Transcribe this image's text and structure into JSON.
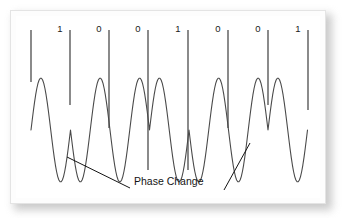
{
  "figure": {
    "kind": "phase-shift-keying-waveform-diagram",
    "background_color": "#ffffff",
    "frame_color": "#e4e4e4",
    "wave_color": "#4a4a4a",
    "tick_color": "#2b2b2b",
    "text_color": "#141414"
  },
  "bits": {
    "sequence": [
      "1",
      "0",
      "0",
      "1",
      "0",
      "0",
      "1"
    ],
    "label_x": [
      50,
      89,
      128,
      168,
      208,
      248,
      288
    ]
  },
  "annotation": {
    "text": "Phase Change",
    "leader_lines": [
      {
        "from_x": 57,
        "from_y": 147,
        "to_x": 120,
        "to_y": 178
      },
      {
        "from_x": 240,
        "from_y": 133,
        "to_x": 214,
        "to_y": 180
      }
    ]
  },
  "chart_data": {
    "type": "line",
    "title": "",
    "xlabel": "",
    "ylabel": "",
    "bit_interval_px": 39.5,
    "tick_x_positions": [
      21,
      60,
      99,
      138,
      178,
      218,
      258,
      298
    ],
    "tick_top_y": 20,
    "tick_bottom_y": [
      72,
      95,
      118,
      160,
      160,
      118,
      95,
      100
    ],
    "bit_values": [
      "1",
      "0",
      "0",
      "1",
      "0",
      "0",
      "1"
    ],
    "phase_changes_at_bits": [
      1,
      3,
      4,
      6
    ],
    "carrier_cycles_per_bit": 1,
    "baseline_y": 120,
    "amplitude_px": 52,
    "xlim": [
      21,
      298
    ],
    "ylim": [
      68,
      172
    ],
    "grid": false,
    "legend": false
  }
}
